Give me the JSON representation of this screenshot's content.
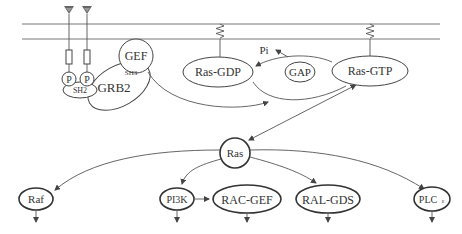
{
  "diagram": {
    "membrane": {
      "top_y": 24,
      "bottom_y": 39
    },
    "nodes": {
      "gef": "GEF",
      "sh3": "SH3",
      "grb2": "GRB2",
      "sh2": "SH2",
      "p1": "P",
      "p2": "P",
      "ras_gdp": "Ras-GDP",
      "gap": "GAP",
      "pi": "Pi",
      "ras_gtp": "Ras-GTP",
      "ras": "Ras",
      "raf": "Raf",
      "pi3k": "PI3K",
      "rac_gef": "RAC-GEF",
      "ral_gds": "RAL-GDS",
      "plc": "PLC",
      "plc_sub": "ε"
    },
    "edges": [
      {
        "from": "GEF",
        "to": "Ras-GTP"
      },
      {
        "from": "Ras-GTP",
        "to": "Ras-GDP",
        "via": "GAP",
        "releases": "Pi"
      },
      {
        "from": "Ras-GDP",
        "to": "Ras-GTP"
      },
      {
        "from": "Ras-GTP",
        "to": "Ras",
        "bidirectional": true
      },
      {
        "from": "Ras",
        "to": "Raf"
      },
      {
        "from": "Ras",
        "to": "PI3K"
      },
      {
        "from": "PI3K",
        "to": "RAC-GEF"
      },
      {
        "from": "Ras",
        "to": "RAL-GDS"
      },
      {
        "from": "Ras",
        "to": "PLCε"
      }
    ]
  }
}
